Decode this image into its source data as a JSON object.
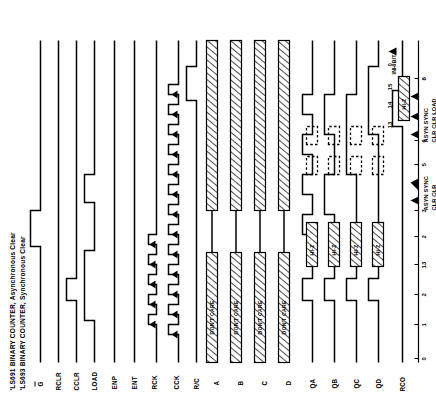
{
  "figure": {
    "titles": [
      "'LS691 BINARY COUNTER, Asynchronous Clear",
      "'LS693 BINARY COUNTER, Synchronous Clear"
    ],
    "signals": [
      {
        "name": "G",
        "overbar": true,
        "label": "G"
      },
      {
        "name": "RCLR",
        "overbar": false,
        "label": "RCLR"
      },
      {
        "name": "CCLR",
        "overbar": false,
        "label": "CCLR"
      },
      {
        "name": "LOAD",
        "overbar": false,
        "label": "LOAD"
      },
      {
        "name": "ENP",
        "overbar": false,
        "label": "ENP"
      },
      {
        "name": "ENT",
        "overbar": false,
        "label": "ENT"
      },
      {
        "name": "RCK",
        "overbar": false,
        "label": "RCK"
      },
      {
        "name": "CCK",
        "overbar": false,
        "label": "CCK"
      },
      {
        "name": "R/C",
        "overbar": false,
        "label": "R/C"
      },
      {
        "name": "A",
        "overbar": false,
        "label": "A"
      },
      {
        "name": "B",
        "overbar": false,
        "label": "B"
      },
      {
        "name": "C",
        "overbar": false,
        "label": "C"
      },
      {
        "name": "D",
        "overbar": false,
        "label": "D"
      },
      {
        "name": "QA",
        "overbar": false,
        "label": "QA"
      },
      {
        "name": "QB",
        "overbar": false,
        "label": "QB"
      },
      {
        "name": "QC",
        "overbar": false,
        "label": "QC"
      },
      {
        "name": "QD",
        "overbar": false,
        "label": "QD"
      },
      {
        "name": "RCO",
        "overbar": false,
        "label": "RCO"
      }
    ],
    "inline_labels": {
      "dont_care": "DON'T CARE",
      "hi_z": "HI-Z",
      "inhibit": "INHIBIT"
    },
    "count_sequence": [
      "0",
      "1",
      "2",
      "13",
      "2",
      "3",
      "5",
      "6",
      "8"
    ],
    "annotations": [
      {
        "id": "ann-left",
        "line1": "ASYN SYNC",
        "line2": "CLR  CLR"
      },
      {
        "id": "ann-right",
        "line1": "ASYN SYNC",
        "line2": "CLR  CLR  LOAD"
      }
    ],
    "right_counts": [
      "13",
      "14",
      "15",
      "0"
    ],
    "colors": {
      "ink": "#000000",
      "paper": "#ffffff"
    }
  }
}
